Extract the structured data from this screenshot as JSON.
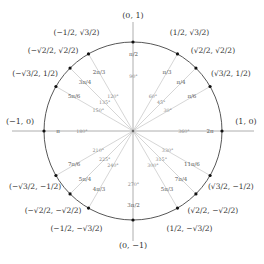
{
  "diagram": {
    "center": [
      133,
      131
    ],
    "radius": 89,
    "colors": {
      "circle": "#444444",
      "axis": "#999999",
      "ray": "#cccccc",
      "dot": "#111111",
      "text": "#333333"
    },
    "axis_points": [
      {
        "label": "(1, 0)",
        "angle_deg": 0,
        "radian": "2π",
        "degree": "360°"
      },
      {
        "label": "(0, 1)",
        "angle_deg": 90,
        "radian": "π/2",
        "degree": "90°"
      },
      {
        "label": "(−1, 0)",
        "angle_deg": 180,
        "radian": "π",
        "degree": "180°"
      },
      {
        "label": "(0, −1)",
        "angle_deg": 270,
        "radian": "3π/2",
        "degree": "270°"
      }
    ],
    "angles": [
      {
        "deg": 30,
        "degree": "30°",
        "radian": "π/6",
        "coord": "(√3/2, 1/2)"
      },
      {
        "deg": 45,
        "degree": "45°",
        "radian": "π/4",
        "coord": "(√2/2, √2/2)"
      },
      {
        "deg": 60,
        "degree": "60°",
        "radian": "π/3",
        "coord": "(1/2, √3/2)"
      },
      {
        "deg": 120,
        "degree": "120°",
        "radian": "2π/3",
        "coord": "(−1/2, √3/2)"
      },
      {
        "deg": 135,
        "degree": "135°",
        "radian": "3π/4",
        "coord": "(−√2/2, √2/2)"
      },
      {
        "deg": 150,
        "degree": "150°",
        "radian": "5π/6",
        "coord": "(−√3/2, 1/2)"
      },
      {
        "deg": 210,
        "degree": "210°",
        "radian": "7π/6",
        "coord": "(−√3/2, −1/2)"
      },
      {
        "deg": 225,
        "degree": "225°",
        "radian": "5π/4",
        "coord": "(−√2/2, −√2/2)"
      },
      {
        "deg": 240,
        "degree": "240°",
        "radian": "4π/3",
        "coord": "(−1/2, −√3/2)"
      },
      {
        "deg": 300,
        "degree": "300°",
        "radian": "5π/3",
        "coord": "(1/2, −√3/2)"
      },
      {
        "deg": 315,
        "degree": "315°",
        "radian": "7π/4",
        "coord": "(√2/2, −√2/2)"
      },
      {
        "deg": 330,
        "degree": "330°",
        "radian": "11π/6",
        "coord": "(√3/2, −1/2)"
      }
    ]
  }
}
